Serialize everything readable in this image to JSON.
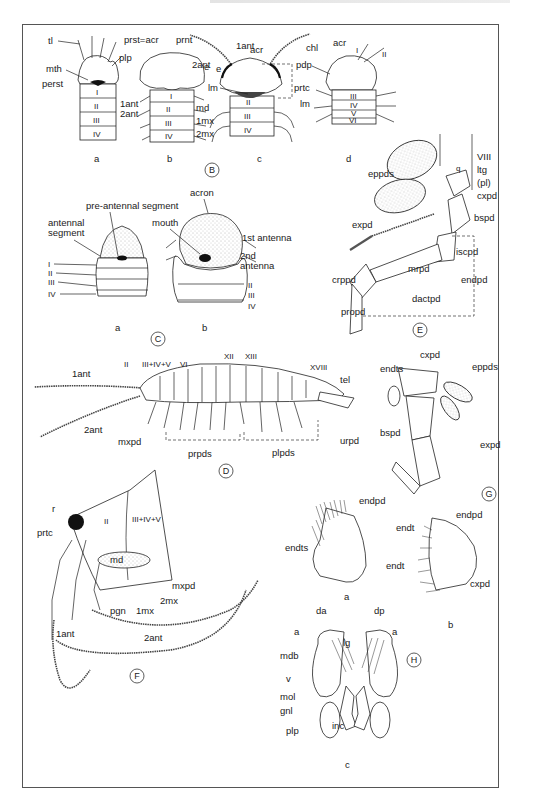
{
  "plate": {
    "panels": {
      "B": {
        "letter": "B",
        "sub_a": {
          "letter": "a",
          "labels": [
            "tl",
            "plp",
            "mth",
            "perst",
            "I",
            "II",
            "III",
            "IV"
          ]
        },
        "sub_b": {
          "letter": "b",
          "labels": [
            "prst=acr",
            "prnt",
            "e",
            "1ant",
            "2ant",
            "md",
            "1mx",
            "2mx",
            "I",
            "II",
            "III",
            "IV"
          ]
        },
        "sub_c": {
          "letter": "c",
          "labels": [
            "1ant",
            "acr",
            "2ant",
            "e",
            "lm",
            "prtc",
            "II",
            "III",
            "IV"
          ]
        },
        "sub_d": {
          "letter": "d",
          "labels": [
            "chl",
            "acr",
            "I",
            "II",
            "pdp",
            "lm",
            "III",
            "IV",
            "V",
            "VI"
          ]
        }
      },
      "C": {
        "letter": "C",
        "sub_a": {
          "letter": "a",
          "labels": [
            "pre-antennal segment",
            "antennal segment",
            "I",
            "II",
            "III",
            "IV"
          ]
        },
        "sub_b": {
          "letter": "b",
          "labels": [
            "acron",
            "mouth",
            "1st antenna",
            "2nd",
            "antenna",
            "II",
            "III",
            "IV"
          ]
        }
      },
      "D": {
        "letter": "D",
        "labels": [
          "1ant",
          "2ant",
          "II",
          "III+IV+V",
          "VI",
          "XII",
          "XIII",
          "XVIII",
          "tel",
          "mxpd",
          "prpds",
          "plpds",
          "urpd"
        ]
      },
      "E": {
        "letter": "E",
        "labels": [
          "VIII",
          "ltg",
          "(pl)",
          "eppds",
          "q",
          "cxpd",
          "bspd",
          "expd",
          "iscpd",
          "crppd",
          "mrpd",
          "endpd",
          "dactpd",
          "propd"
        ]
      },
      "F": {
        "letter": "F",
        "labels": [
          "r",
          "II",
          "III+IV+V",
          "prtc",
          "md",
          "mxpd",
          "pgn",
          "1mx",
          "2mx",
          "1ant",
          "2ant"
        ]
      },
      "G": {
        "letter": "G",
        "labels": [
          "cxpd",
          "endts",
          "eppds",
          "bspd",
          "expd"
        ]
      },
      "H": {
        "letter": "H",
        "sub_a": {
          "letter": "a",
          "labels": [
            "endpd",
            "endts"
          ]
        },
        "sub_b": {
          "letter": "b",
          "labels": [
            "endt",
            "endpd",
            "endt",
            "cxpd"
          ]
        },
        "sub_c": {
          "letter": "c",
          "labels": [
            "da",
            "dp",
            "a",
            "a",
            "lg",
            "mdb",
            "v",
            "mol",
            "gnl",
            "plp",
            "inc"
          ]
        }
      }
    }
  }
}
